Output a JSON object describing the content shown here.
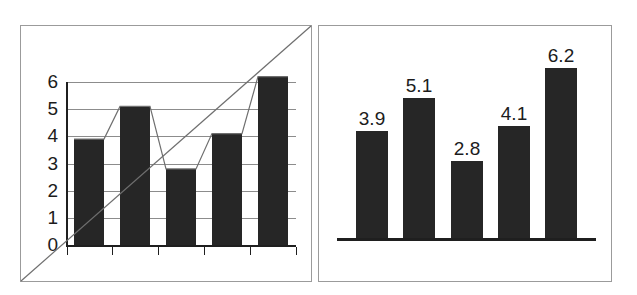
{
  "figure": {
    "background_color": "#ffffff",
    "bar_color": "#262626",
    "grid_color": "#8c8c8c",
    "axis_color": "#1f1f1f",
    "frame_color": "#9b9b9b",
    "panel_count": 2
  },
  "chart_data": [
    {
      "type": "bar",
      "panel": "left",
      "title": "",
      "xlabel": "",
      "ylabel": "",
      "categories": [
        "1",
        "2",
        "3",
        "4",
        "5"
      ],
      "values": [
        3.9,
        5.1,
        2.8,
        4.1,
        6.2
      ],
      "ylim": [
        0,
        6
      ],
      "ytick_labels": [
        "0",
        "1",
        "2",
        "3",
        "4",
        "5",
        "6"
      ],
      "ytick_values": [
        0,
        1,
        2,
        3,
        4,
        5,
        6
      ],
      "grid": true,
      "grid_axis": "y",
      "legend": "none",
      "data_labels": false,
      "xtick_count": 6,
      "xtick_labels": [
        "",
        "",
        "",
        "",
        "",
        ""
      ],
      "overlays": [
        {
          "name": "bar-top-polyline",
          "type": "line",
          "description": "thin line connecting the tops of the bars",
          "values": [
            3.9,
            5.1,
            2.8,
            4.1,
            6.2
          ]
        },
        {
          "name": "corner-diagonal",
          "type": "line",
          "description": "straight diagonal line from panel bottom-left corner to panel top-right corner"
        }
      ]
    },
    {
      "type": "bar",
      "panel": "right",
      "title": "",
      "xlabel": "",
      "ylabel": "",
      "categories": [
        "1",
        "2",
        "3",
        "4",
        "5"
      ],
      "values": [
        3.9,
        5.1,
        2.8,
        4.1,
        6.2
      ],
      "ylim": [
        0,
        6.2
      ],
      "grid": false,
      "legend": "none",
      "data_labels": true,
      "data_label_texts": [
        "3.9",
        "5.1",
        "2.8",
        "4.1",
        "6.2"
      ],
      "axes_visible": "baseline-only"
    }
  ],
  "left_chart": {
    "y_axis_labels": [
      "6",
      "5",
      "4",
      "3",
      "2",
      "1",
      "0"
    ]
  },
  "right_chart": {
    "value_labels": [
      "3.9",
      "5.1",
      "2.8",
      "4.1",
      "6.2"
    ]
  }
}
